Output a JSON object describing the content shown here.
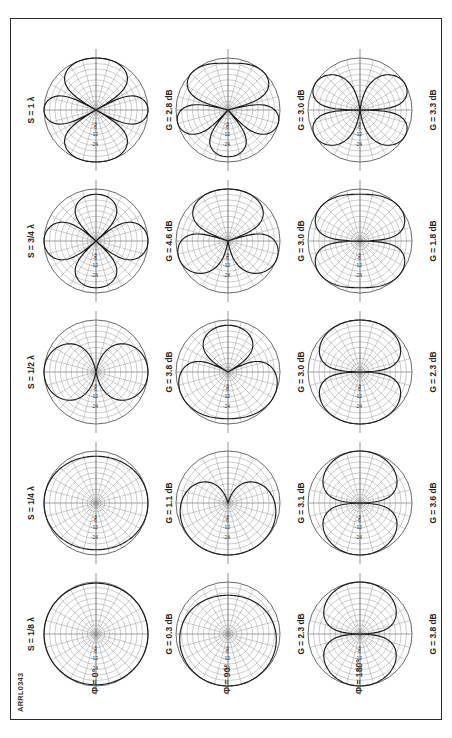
{
  "figure": {
    "id": "ARRL0343",
    "type": "polar-pattern-matrix",
    "rows": 3,
    "cols": 5,
    "border_color": "#2a2a2a",
    "grid_color": "#8f8f8f",
    "trace_color": "#1a1a1a"
  },
  "column_headers": [
    {
      "label": "S = 1/8 λ"
    },
    {
      "label": "S = 1/4 λ"
    },
    {
      "label": "S = 1/2 λ"
    },
    {
      "label": "S = 3/4 λ"
    },
    {
      "label": "S = 1 λ"
    }
  ],
  "row_headers": [
    {
      "label": "Φ = 0°"
    },
    {
      "label": "Φ = 90°"
    },
    {
      "label": "Φ = 180°"
    }
  ],
  "ring_labels": [
    "-3",
    "-6",
    "-12",
    "-24"
  ],
  "gains": [
    [
      "G = 0.3 dB",
      "G = 1.1 dB",
      "G = 3.8 dB",
      "G = 4.6 dB",
      "G = 2.8 dB"
    ],
    [
      "G = 2.3 dB",
      "G = 3.1 dB",
      "G = 3.0 dB",
      "G = 3.0 dB",
      "G = 3.0 dB"
    ],
    [
      "G = 3.8 dB",
      "G = 3.6 dB",
      "G = 2.3 dB",
      "G = 1.8 dB",
      "G = 3.3 dB"
    ]
  ],
  "chart_data": {
    "type": "line",
    "xlabel": "",
    "ylabel": "",
    "polar": true,
    "radial_scale_db": [
      -3,
      -6,
      -12,
      -24
    ],
    "radial_min_db": -30,
    "radial_max_db": 0,
    "grid": true,
    "legend": "none",
    "col_variable": "S (element spacing)",
    "row_variable": "Φ (phase difference)",
    "categories": [
      "S = 1/8 λ",
      "S = 1/4 λ",
      "S = 1/2 λ",
      "S = 3/4 λ",
      "S = 1 λ"
    ],
    "series": [
      {
        "name": "Φ = 0°",
        "cells": [
          {
            "spacing": "1/8 λ",
            "gain_dbi": 0.3,
            "lobes": 1,
            "shape": "broad-cardioid-left"
          },
          {
            "spacing": "1/4 λ",
            "gain_dbi": 1.1,
            "lobes": 1,
            "shape": "broad-oval-left"
          },
          {
            "spacing": "1/2 λ",
            "gain_dbi": 3.8,
            "lobes": 2,
            "shape": "bidirectional-broadside"
          },
          {
            "spacing": "3/4 λ",
            "gain_dbi": 4.6,
            "lobes": 4,
            "shape": "four-lobe-clover"
          },
          {
            "spacing": "1 λ",
            "gain_dbi": 2.8,
            "lobes": 4,
            "shape": "four-lobe-clover"
          }
        ]
      },
      {
        "name": "Φ = 90°",
        "cells": [
          {
            "spacing": "1/8 λ",
            "gain_dbi": 2.3,
            "lobes": 1,
            "shape": "cardioid"
          },
          {
            "spacing": "1/4 λ",
            "gain_dbi": 3.1,
            "lobes": 1,
            "shape": "cardioid-deep-null"
          },
          {
            "spacing": "1/2 λ",
            "gain_dbi": 3.0,
            "lobes": 2,
            "shape": "twin-lobe-endfire"
          },
          {
            "spacing": "3/4 λ",
            "gain_dbi": 3.0,
            "lobes": 4,
            "shape": "four-lobe"
          },
          {
            "spacing": "1 λ",
            "gain_dbi": 3.0,
            "lobes": 4,
            "shape": "four-lobe"
          }
        ]
      },
      {
        "name": "Φ = 180°",
        "cells": [
          {
            "spacing": "1/8 λ",
            "gain_dbi": 3.8,
            "lobes": 2,
            "shape": "figure-eight"
          },
          {
            "spacing": "1/4 λ",
            "gain_dbi": 3.6,
            "lobes": 2,
            "shape": "figure-eight"
          },
          {
            "spacing": "1/2 λ",
            "gain_dbi": 2.3,
            "lobes": 2,
            "shape": "figure-eight-wide"
          },
          {
            "spacing": "3/4 λ",
            "gain_dbi": 1.8,
            "lobes": 4,
            "shape": "four-lobe"
          },
          {
            "spacing": "1 λ",
            "gain_dbi": 3.3,
            "lobes": 6,
            "shape": "multi-lobe"
          }
        ]
      }
    ]
  }
}
